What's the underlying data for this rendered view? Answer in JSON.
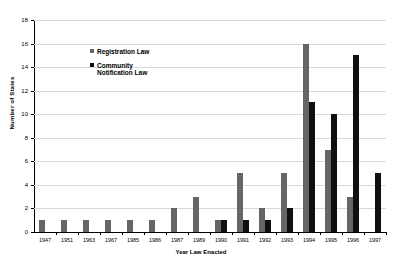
{
  "chart_data": {
    "type": "bar",
    "title": "",
    "xlabel": "Year Law Enacted",
    "ylabel": "Number of States",
    "ylim": [
      0,
      18
    ],
    "ytick_step": 2,
    "yticks": [
      0,
      2,
      4,
      6,
      8,
      10,
      12,
      14,
      16,
      18
    ],
    "grid": true,
    "legend_position": "inside-upper-left",
    "categories": [
      "1947",
      "1951",
      "1963",
      "1967",
      "1985",
      "1986",
      "1987",
      "1989",
      "1990",
      "1991",
      "1992",
      "1993",
      "1994",
      "1995",
      "1996",
      "1997"
    ],
    "series": [
      {
        "name": "Registration Law",
        "color": "#666666",
        "values": [
          1,
          1,
          1,
          1,
          1,
          1,
          2,
          3,
          1,
          5,
          2,
          5,
          16,
          7,
          3,
          0
        ]
      },
      {
        "name": "Community Notification Law",
        "color": "#101010",
        "values": [
          0,
          0,
          0,
          0,
          0,
          0,
          0,
          0,
          1,
          1,
          1,
          2,
          11,
          10,
          15,
          5
        ]
      }
    ]
  },
  "legend": {
    "items": [
      {
        "label": "Registration Law",
        "marker": "square-swatch-gray"
      },
      {
        "label": "Community\nNotification Law",
        "marker": "square-swatch-black"
      }
    ]
  }
}
